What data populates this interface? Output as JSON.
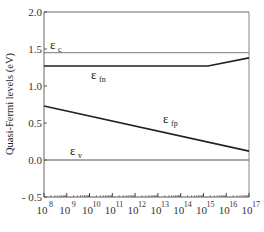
{
  "chart_data": {
    "type": "line",
    "title": "",
    "xlabel": "",
    "ylabel": "Quasi-Fermi levels (eV)",
    "xscale": "log",
    "x_tick_exponents": [
      8,
      9,
      10,
      11,
      12,
      13,
      14,
      15,
      16,
      17
    ],
    "x_tick_base": "10",
    "ylim": [
      -0.5,
      2.0
    ],
    "y_ticks": [
      "2.0",
      "1.5",
      "1.0",
      "0.5",
      "0.0",
      "- 0.5"
    ],
    "grid": false,
    "series": [
      {
        "name": "εc",
        "label_main": "ε",
        "label_sub": "c",
        "x_log": [
          8,
          17
        ],
        "y": [
          1.45,
          1.45
        ],
        "stroke": "#777777",
        "width": 1
      },
      {
        "name": "εfn",
        "label_main": "ε",
        "label_sub": "fn",
        "x_log": [
          8,
          15.2,
          17
        ],
        "y": [
          1.27,
          1.27,
          1.38
        ],
        "stroke": "#222222",
        "width": 1.6
      },
      {
        "name": "εfp",
        "label_main": "ε",
        "label_sub": "fp",
        "x_log": [
          8,
          17
        ],
        "y": [
          0.73,
          0.12
        ],
        "stroke": "#222222",
        "width": 1.6
      },
      {
        "name": "εv",
        "label_main": "ε",
        "label_sub": "v",
        "x_log": [
          8,
          17
        ],
        "y": [
          0.0,
          0.0
        ],
        "stroke": "#555555",
        "width": 1
      }
    ]
  }
}
